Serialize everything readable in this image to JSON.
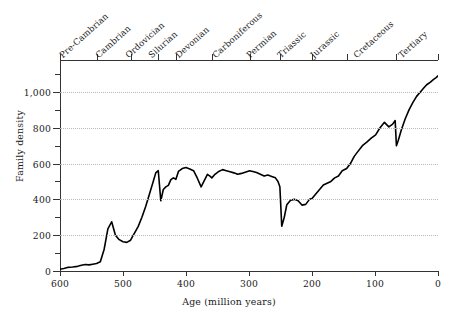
{
  "chart_data": {
    "type": "line",
    "title": "",
    "xlabel": "Age (million years)",
    "ylabel": "Family density",
    "xlim": [
      600,
      0
    ],
    "ylim": [
      0,
      1100
    ],
    "x_reversed": true,
    "grid": true,
    "legend": false,
    "x_ticks": [
      600,
      500,
      400,
      300,
      200,
      100,
      0
    ],
    "x_tick_labels": [
      "600",
      "500",
      "400",
      "300",
      "200",
      "100",
      "0"
    ],
    "y_ticks": [
      0,
      200,
      400,
      600,
      800,
      1000
    ],
    "y_tick_labels": [
      "0",
      "200",
      "400",
      "600",
      "800",
      "1,000"
    ],
    "y_minor_ticks": [
      100,
      300,
      500,
      700,
      900,
      1100
    ],
    "gridline_values": [
      200,
      400,
      600,
      800,
      1000
    ],
    "top_axis": {
      "name": "geological-periods",
      "boundaries": [
        600,
        542,
        488,
        444,
        416,
        359,
        299,
        251,
        200,
        145,
        66,
        0
      ],
      "periods": [
        {
          "label": "Pre-Cambrian",
          "start": 600,
          "end": 542
        },
        {
          "label": "Cambrian",
          "start": 542,
          "end": 488
        },
        {
          "label": "Ordovician",
          "start": 488,
          "end": 444
        },
        {
          "label": "Silurian",
          "start": 444,
          "end": 416
        },
        {
          "label": "Devonian",
          "start": 416,
          "end": 359
        },
        {
          "label": "Carboniferous",
          "start": 359,
          "end": 299
        },
        {
          "label": "Permian",
          "start": 299,
          "end": 251
        },
        {
          "label": "Triassic",
          "start": 251,
          "end": 200
        },
        {
          "label": "Jurassic",
          "start": 200,
          "end": 145
        },
        {
          "label": "Cretaceous",
          "start": 145,
          "end": 66
        },
        {
          "label": "Tertiary",
          "start": 66,
          "end": 0
        }
      ]
    },
    "series": [
      {
        "name": "Family density",
        "color": "#000000",
        "x": [
          600,
          594,
          588,
          580,
          572,
          566,
          560,
          554,
          548,
          542,
          536,
          530,
          524,
          518,
          512,
          506,
          500,
          494,
          488,
          482,
          476,
          470,
          464,
          458,
          452,
          448,
          444,
          440,
          436,
          432,
          428,
          424,
          420,
          416,
          412,
          406,
          400,
          394,
          388,
          382,
          376,
          370,
          366,
          362,
          359,
          354,
          348,
          342,
          336,
          330,
          324,
          318,
          312,
          306,
          299,
          294,
          288,
          282,
          276,
          270,
          264,
          258,
          254,
          251,
          248,
          244,
          240,
          234,
          228,
          222,
          216,
          210,
          204,
          200,
          194,
          188,
          182,
          176,
          170,
          164,
          158,
          152,
          145,
          139,
          133,
          127,
          120,
          113,
          106,
          99,
          92,
          85,
          78,
          72,
          68,
          66,
          63,
          58,
          52,
          46,
          40,
          34,
          28,
          23,
          18,
          12,
          7,
          3,
          0
        ],
        "y": [
          10,
          14,
          20,
          22,
          26,
          32,
          36,
          34,
          38,
          42,
          52,
          120,
          235,
          275,
          200,
          175,
          163,
          160,
          172,
          210,
          248,
          300,
          360,
          430,
          500,
          548,
          560,
          392,
          455,
          470,
          478,
          510,
          520,
          512,
          556,
          572,
          578,
          570,
          560,
          518,
          470,
          512,
          540,
          530,
          520,
          540,
          556,
          566,
          560,
          554,
          548,
          540,
          545,
          552,
          560,
          556,
          550,
          540,
          530,
          536,
          528,
          520,
          500,
          470,
          250,
          300,
          370,
          395,
          400,
          392,
          368,
          372,
          400,
          405,
          430,
          455,
          480,
          490,
          500,
          520,
          530,
          560,
          572,
          600,
          640,
          668,
          700,
          720,
          742,
          760,
          800,
          830,
          805,
          820,
          840,
          700,
          730,
          790,
          850,
          900,
          940,
          975,
          1000,
          1020,
          1040,
          1055,
          1070,
          1080,
          1090
        ]
      }
    ]
  },
  "axes": {
    "x_title": "Age (million years)",
    "y_title": "Family density"
  }
}
